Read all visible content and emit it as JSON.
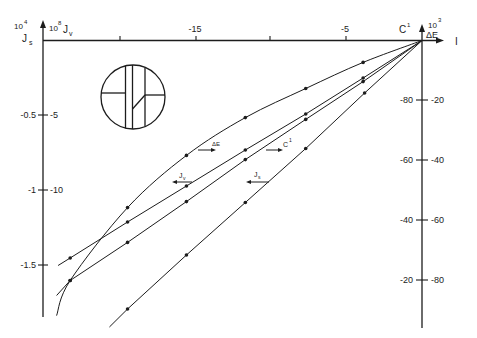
{
  "style": {
    "ink": "#1c1c1c",
    "background": "#ffffff"
  },
  "figure": {
    "left_axis": {
      "js_base": "10",
      "js_exp": "4",
      "js_symbol": "J",
      "js_sub": "s",
      "jv_base": "10",
      "jv_exp": "8",
      "jv_symbol": "J",
      "jv_sub": "v",
      "ticks": [
        {
          "js": "-0.5",
          "jv": "-5"
        },
        {
          "js": "-1",
          "jv": "-10"
        },
        {
          "js": "-1.5",
          "jv": ""
        }
      ]
    },
    "top_axis": {
      "symbol": "C",
      "sup": "1",
      "ticks": [
        {
          "label": ""
        },
        {
          "label": "-15"
        },
        {
          "label": ""
        },
        {
          "label": "-5"
        }
      ]
    },
    "right_axis": {
      "base": "10",
      "exp": "3",
      "symbol": "ΔE",
      "ticks": [
        {
          "left": "-80",
          "right": "-20"
        },
        {
          "left": "-60",
          "right": "-40"
        },
        {
          "left": "-40",
          "right": "-60"
        },
        {
          "left": "-20",
          "right": "-80"
        }
      ]
    },
    "corner_label": "I",
    "legend": {
      "delta_e": {
        "text": "ΔE",
        "arrow": "right"
      },
      "c1": {
        "text": "C",
        "sup": "1",
        "arrow": "right"
      },
      "jv": {
        "text": "J",
        "sub": "v",
        "arrow": "left"
      },
      "js": {
        "text": "J",
        "sub": "s",
        "arrow": "left"
      }
    },
    "inset": {
      "description": "circle schematic with three vertical membranes, two horizontal bars and one diagonal"
    }
  },
  "chart_data": {
    "type": "line",
    "title": "",
    "xlabel": "C¹",
    "ylabel_left": [
      "10⁴ Js",
      "10⁸ Jv"
    ],
    "ylabel_right": "10³ ΔE",
    "x_ticks": [
      -20,
      -15,
      -10,
      -5,
      0
    ],
    "x_tick_labels": [
      "",
      "-15",
      "",
      "-5",
      ""
    ],
    "left_ticks_js": [
      -0.5,
      -1,
      -1.5
    ],
    "left_ticks_jv": [
      -5,
      -10
    ],
    "right_ticks_outer": [
      -20,
      -40,
      -60,
      -80
    ],
    "right_ticks_inner": [
      -80,
      -60,
      -40,
      -20
    ],
    "xlim": [
      -24.5,
      0
    ],
    "grid": false,
    "legend_position": "inline labels with arrows pointing to reading axis",
    "origin": [
      0,
      0
    ],
    "series": [
      {
        "name": "ΔE",
        "axis": "right",
        "shape": "curve",
        "x": [
          -3.9,
          -7.7,
          -11.7,
          -15.6,
          -19.5,
          -23.3
        ],
        "values": [
          -7.3,
          -16,
          -25.7,
          -38.3,
          -55.7,
          -80
        ],
        "end": [
          -24.2,
          -91.7
        ]
      },
      {
        "name": "C¹",
        "axis": "right",
        "shape": "line",
        "x": [
          -3.9,
          -7.7,
          -11.7,
          -15.6,
          -19.5,
          -23.3
        ],
        "values": [
          -13.7,
          -26.3,
          -39.7,
          -53.7,
          -67.3,
          -80
        ],
        "end": [
          -24.2,
          -85
        ]
      },
      {
        "name": "Jv",
        "axis": "left_jv",
        "shape": "line",
        "x": [
          -3.9,
          -7.7,
          -11.7,
          -15.6,
          -19.5,
          -23.3
        ],
        "values": [
          -2.5,
          -4.9,
          -7.3,
          -9.7,
          -12.1,
          -14.5
        ],
        "end": [
          -24.1,
          -15
        ]
      },
      {
        "name": "Js",
        "axis": "left_js",
        "shape": "line",
        "x": [
          -3.8,
          -7.7,
          -11.7,
          -15.6,
          -19.5
        ],
        "values": [
          -0.35,
          -0.72,
          -1.08,
          -1.43,
          -1.79
        ],
        "end": [
          -20.7,
          -1.91
        ]
      }
    ]
  }
}
